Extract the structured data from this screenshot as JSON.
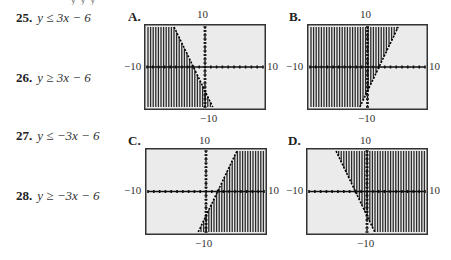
{
  "exercises": [
    {
      "number": "25.",
      "lhs": "y",
      "rel": "≤",
      "rhs": "3x − 6"
    },
    {
      "number": "26.",
      "lhs": "y",
      "rel": "≥",
      "rhs": "3x − 6"
    },
    {
      "number": "27.",
      "lhs": "y",
      "rel": "≤",
      "rhs": "−3x − 6"
    },
    {
      "number": "28.",
      "lhs": "y",
      "rel": "≥",
      "rhs": "−3x − 6"
    }
  ],
  "graphs": [
    {
      "label": "A.",
      "ymax": "10",
      "ymin": "−10",
      "xmin": "−10",
      "xmax": "10"
    },
    {
      "label": "B.",
      "ymax": "10",
      "ymin": "−10",
      "xmin": "−10",
      "xmax": "10"
    },
    {
      "label": "C.",
      "ymax": "10",
      "ymin": "−10",
      "xmin": "−10",
      "xmax": "10"
    },
    {
      "label": "D.",
      "ymax": "10",
      "ymin": "−10",
      "xmin": "−10",
      "xmax": "10"
    }
  ],
  "chart_data": [
    {
      "type": "region",
      "title": "A.",
      "boundary": "y = -3x - 6",
      "shaded": "below (left)",
      "xlim": [
        -10,
        10
      ],
      "ylim": [
        -10,
        10
      ]
    },
    {
      "type": "region",
      "title": "B.",
      "boundary": "y = 3x - 6",
      "shaded": "above (left)",
      "xlim": [
        -10,
        10
      ],
      "ylim": [
        -10,
        10
      ]
    },
    {
      "type": "region",
      "title": "C.",
      "boundary": "y = 3x - 6",
      "shaded": "below (right)",
      "xlim": [
        -10,
        10
      ],
      "ylim": [
        -10,
        10
      ]
    },
    {
      "type": "region",
      "title": "D.",
      "boundary": "y = -3x - 6",
      "shaded": "above (right)",
      "xlim": [
        -10,
        10
      ],
      "ylim": [
        -10,
        10
      ]
    }
  ]
}
